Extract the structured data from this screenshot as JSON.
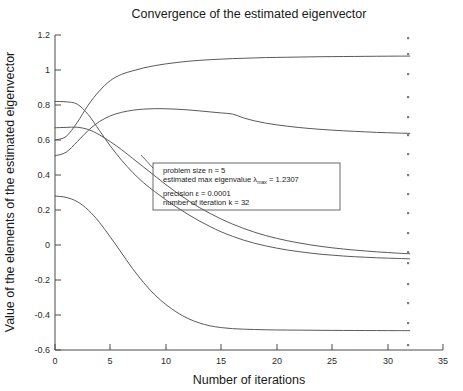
{
  "figure": {
    "title": "Convergence of the estimated eigenvector",
    "xlabel": "Number of iterations",
    "ylabel": "Value of the elements of the estimated eigenvector"
  },
  "annotation": {
    "line1": "problem size n = 5",
    "line2_a": "estimated max eigenvalue λ",
    "line2_sub": "max",
    "line2_b": " =  1.2307",
    "line3": "precision ε =  0.0001",
    "line4": "number of iteration k = 32"
  },
  "chart_data": {
    "type": "line",
    "title": "Convergence of the estimated eigenvector",
    "xlabel": "Number of iterations",
    "ylabel": "Value of the elements of the estimated eigenvector",
    "xlim": [
      0,
      35
    ],
    "ylim": [
      -0.6,
      1.2
    ],
    "xticks": [
      0,
      5,
      10,
      15,
      20,
      25,
      30,
      35
    ],
    "yticks": [
      -0.6,
      -0.4,
      -0.2,
      0,
      0.2,
      0.4,
      0.6,
      0.8,
      1,
      1.2
    ],
    "xtick_labels": [
      "0",
      "5",
      "10",
      "15",
      "20",
      "25",
      "30",
      "35"
    ],
    "ytick_labels": [
      "-0.6",
      "-0.4",
      "-0.2",
      "0",
      "0.2",
      "0.4",
      "0.6",
      "0.8",
      "1",
      "1.2"
    ],
    "grid": false,
    "legend": "none",
    "x": [
      0,
      1,
      2,
      3,
      4,
      5,
      6,
      7,
      8,
      9,
      10,
      11,
      12,
      13,
      14,
      15,
      16,
      17,
      18,
      19,
      20,
      21,
      22,
      23,
      24,
      25,
      26,
      27,
      28,
      29,
      30,
      31,
      32
    ],
    "series": [
      {
        "name": "element 1",
        "values": [
          0.6,
          0.62,
          0.7,
          0.8,
          0.88,
          0.94,
          0.975,
          0.995,
          1.012,
          1.025,
          1.035,
          1.043,
          1.05,
          1.055,
          1.059,
          1.062,
          1.065,
          1.067,
          1.069,
          1.071,
          1.072,
          1.073,
          1.074,
          1.075,
          1.076,
          1.0765,
          1.077,
          1.0775,
          1.078,
          1.0785,
          1.079,
          1.0793,
          1.0795
        ]
      },
      {
        "name": "element 2",
        "values": [
          0.51,
          0.53,
          0.59,
          0.655,
          0.705,
          0.738,
          0.758,
          0.77,
          0.7765,
          0.779,
          0.7785,
          0.776,
          0.772,
          0.7665,
          0.7605,
          0.7545,
          0.7485,
          0.7265,
          0.7095,
          0.6965,
          0.6865,
          0.6785,
          0.6715,
          0.6655,
          0.6605,
          0.6565,
          0.6525,
          0.6495,
          0.6465,
          0.6435,
          0.6415,
          0.6395,
          0.638
        ]
      },
      {
        "name": "element 3",
        "values": [
          0.82,
          0.818,
          0.805,
          0.745,
          0.655,
          0.565,
          0.485,
          0.415,
          0.355,
          0.305,
          0.258,
          0.215,
          0.175,
          0.138,
          0.105,
          0.075,
          0.05,
          0.028,
          0.01,
          -0.005,
          -0.018,
          -0.029,
          -0.038,
          -0.046,
          -0.053,
          -0.058,
          -0.063,
          -0.067,
          -0.07,
          -0.073,
          -0.075,
          -0.077,
          -0.079
        ]
      },
      {
        "name": "element 4",
        "values": [
          0.67,
          0.672,
          0.673,
          0.66,
          0.63,
          0.59,
          0.545,
          0.495,
          0.445,
          0.395,
          0.345,
          0.298,
          0.255,
          0.215,
          0.18,
          0.148,
          0.12,
          0.095,
          0.073,
          0.054,
          0.038,
          0.024,
          0.012,
          0.001,
          -0.008,
          -0.016,
          -0.023,
          -0.029,
          -0.034,
          -0.039,
          -0.043,
          -0.047,
          -0.05
        ]
      },
      {
        "name": "element 5",
        "values": [
          0.28,
          0.272,
          0.248,
          0.2,
          0.13,
          0.045,
          -0.045,
          -0.135,
          -0.215,
          -0.285,
          -0.34,
          -0.385,
          -0.42,
          -0.445,
          -0.462,
          -0.472,
          -0.478,
          -0.481,
          -0.483,
          -0.4845,
          -0.4855,
          -0.486,
          -0.4865,
          -0.487,
          -0.4875,
          -0.488,
          -0.4882,
          -0.4885,
          -0.4888,
          -0.489,
          -0.4892,
          -0.4894,
          -0.4895
        ]
      }
    ]
  },
  "specks": {
    "x": 408,
    "y": [
      37,
      53,
      73,
      96,
      116,
      134,
      153,
      174,
      193,
      212,
      232,
      251,
      262,
      283,
      302,
      322,
      344
    ]
  }
}
